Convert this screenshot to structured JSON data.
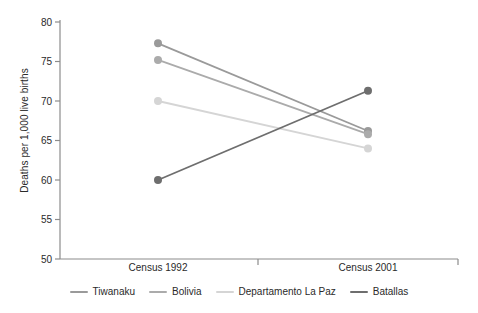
{
  "chart_data": {
    "type": "line",
    "title": "",
    "xlabel": "",
    "ylabel": "Deaths per 1,000 live births",
    "categories": [
      "Census 1992",
      "Census 2001"
    ],
    "ylim": [
      50,
      80
    ],
    "yticks": [
      50,
      55,
      60,
      65,
      70,
      75,
      80
    ],
    "grid": false,
    "legend_position": "bottom",
    "markers": "circle",
    "series": [
      {
        "name": "Tiwanaku",
        "values": [
          77.3,
          66.2
        ],
        "color": "#9a9a9a"
      },
      {
        "name": "Bolivia",
        "values": [
          75.2,
          65.8
        ],
        "color": "#ababab"
      },
      {
        "name": "Departamento La Paz",
        "values": [
          70.0,
          64.0
        ],
        "color": "#d5d5d5"
      },
      {
        "name": "Batallas",
        "values": [
          60.0,
          71.3
        ],
        "color": "#6e6e6e"
      }
    ]
  },
  "axis": {
    "y_title": "Deaths per 1,000 live births",
    "y_tick_labels": [
      "80",
      "75",
      "70",
      "65",
      "60",
      "55",
      "50"
    ],
    "x_tick_labels": [
      "Census 1992",
      "Census 2001"
    ]
  },
  "legend": {
    "items": [
      {
        "label": "Tiwanaku",
        "color": "#9a9a9a"
      },
      {
        "label": "Bolivia",
        "color": "#ababab"
      },
      {
        "label": "Departamento La Paz",
        "color": "#d5d5d5"
      },
      {
        "label": "Batallas",
        "color": "#6e6e6e"
      }
    ]
  },
  "colors": {
    "axis": "#8c8c8c",
    "text": "#2a2a2a",
    "background": "#ffffff"
  }
}
